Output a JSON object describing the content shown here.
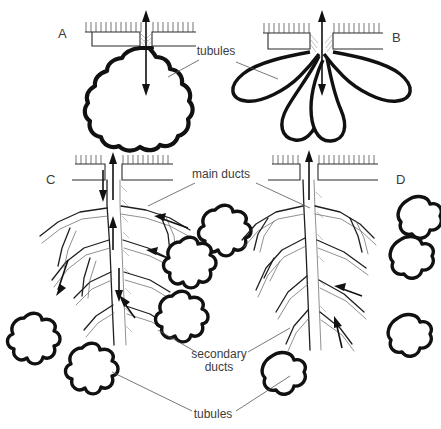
{
  "figure": {
    "background_color": "#ffffff",
    "ink_color": "#111111",
    "width": 441,
    "height": 429
  },
  "panels": [
    {
      "id": "A",
      "letter": "A",
      "x": 58,
      "y": 38,
      "type": "simple-lobed-sac",
      "description": "Simple saccular gland with bumpy lobed wall opening at epithelial surface"
    },
    {
      "id": "B",
      "letter": "B",
      "x": 392,
      "y": 42,
      "type": "multi-lobed-sac",
      "description": "Branched sac with four elongated petal-shaped lobes"
    },
    {
      "id": "C",
      "letter": "C",
      "x": 46,
      "y": 184,
      "type": "branched-duct-tree-rosette",
      "description": "Compound gland: main duct branching into secondary ducts ending in rosette tubule clusters"
    },
    {
      "id": "D",
      "letter": "D",
      "x": 396,
      "y": 184,
      "type": "branched-duct-tree-elongate",
      "description": "Compound gland with elongated irregular tubules on duct branches"
    }
  ],
  "labels": [
    {
      "id": "tubules-top",
      "text": "tubules",
      "x": 216,
      "y": 55,
      "leaders": [
        [
          199,
          60,
          168,
          77
        ],
        [
          236,
          62,
          278,
          79
        ]
      ]
    },
    {
      "id": "main-ducts",
      "text": "main ducts",
      "x": 221,
      "y": 178,
      "leaders": [
        [
          195,
          183,
          148,
          206
        ],
        [
          256,
          183,
          310,
          208
        ]
      ]
    },
    {
      "id": "secondary-ducts-line1",
      "text": "secondary",
      "x": 219,
      "y": 358,
      "leaders": [
        [
          196,
          352,
          158,
          330
        ],
        [
          248,
          352,
          290,
          328
        ]
      ]
    },
    {
      "id": "secondary-ducts-line2",
      "text": "ducts",
      "x": 219,
      "y": 371,
      "leaders": []
    },
    {
      "id": "tubules-bottom",
      "text": "tubules",
      "x": 213,
      "y": 418,
      "leaders": [
        [
          192,
          411,
          112,
          372
        ],
        [
          236,
          411,
          290,
          376
        ]
      ]
    }
  ],
  "annotations": {
    "arrows": [
      {
        "id": "arrow-A",
        "type": "double-headed-vertical",
        "panel": "A"
      },
      {
        "id": "arrow-B",
        "type": "double-headed-vertical",
        "panel": "B"
      },
      {
        "id": "arrow-C-main",
        "type": "single-up",
        "panel": "C"
      },
      {
        "id": "arrow-D-main",
        "type": "single-up",
        "panel": "D"
      }
    ],
    "epithelium": "hatched double line representing surface epithelium with microvilli"
  }
}
